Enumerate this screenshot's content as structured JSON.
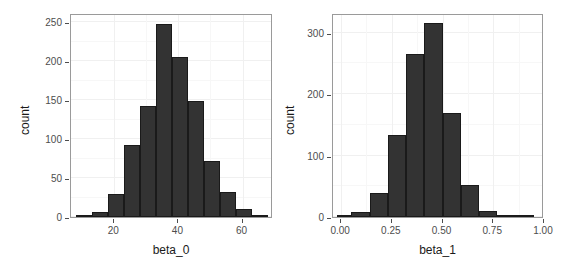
{
  "figure": {
    "background": "#ffffff",
    "bar_color": "#333333",
    "bar_border_color": "#1a1a1a",
    "grid_color": "#f0f0f0",
    "panel_border_color": "#9a9a9a",
    "axis_text_color": "#4d4d4d"
  },
  "chart_data": [
    {
      "type": "bar",
      "title": "",
      "xlabel": "beta_0",
      "ylabel": "count",
      "xlim": [
        6.5,
        69.5
      ],
      "ylim": [
        0,
        262
      ],
      "xticks": [
        20,
        40,
        60
      ],
      "xticklabels": [
        "20",
        "40",
        "60"
      ],
      "yticks": [
        0,
        50,
        100,
        150,
        200,
        250
      ],
      "yticklabels": [
        "0",
        "50",
        "100",
        "150",
        "200",
        "250"
      ],
      "grid": true,
      "legend": "none",
      "bin_edges": [
        8,
        13,
        18,
        23,
        28,
        33,
        38,
        43,
        48,
        53,
        58,
        63,
        68
      ],
      "bin_centers": [
        10.5,
        15.5,
        20.5,
        25.5,
        30.5,
        35.5,
        40.5,
        45.5,
        50.5,
        55.5,
        60.5,
        65.5
      ],
      "values": [
        3,
        6,
        29,
        93,
        142,
        248,
        206,
        149,
        72,
        32,
        10,
        2
      ]
    },
    {
      "type": "bar",
      "title": "",
      "xlabel": "beta_1",
      "ylabel": "count",
      "xlim": [
        -0.04,
        1.0
      ],
      "ylim": [
        0,
        332
      ],
      "xticks": [
        0.0,
        0.25,
        0.5,
        0.75,
        1.0
      ],
      "xticklabels": [
        "0.00",
        "0.25",
        "0.50",
        "0.75",
        "1.00"
      ],
      "yticks": [
        0,
        100,
        200,
        300
      ],
      "yticklabels": [
        "0",
        "100",
        "200",
        "300"
      ],
      "grid": true,
      "legend": "none",
      "bin_edges": [
        -0.02,
        0.05,
        0.14,
        0.23,
        0.32,
        0.41,
        0.5,
        0.59,
        0.68,
        0.77,
        0.86,
        0.95
      ],
      "bin_centers": [
        0.015,
        0.095,
        0.185,
        0.275,
        0.365,
        0.455,
        0.545,
        0.635,
        0.725,
        0.815,
        0.905
      ],
      "values": [
        1,
        8,
        39,
        133,
        265,
        316,
        170,
        52,
        9,
        1,
        1
      ]
    }
  ]
}
